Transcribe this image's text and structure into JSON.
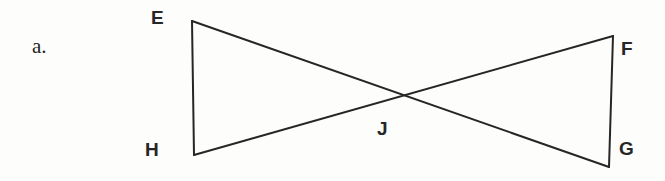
{
  "figure": {
    "item_label": "a.",
    "background_color": "#fdfdfc",
    "stroke_color": "#262626",
    "stroke_width": 2,
    "vertices": [
      {
        "name": "E",
        "label": "E",
        "x": 192,
        "y": 21,
        "label_x": 151,
        "label_y": 8
      },
      {
        "name": "F",
        "label": "F",
        "x": 613,
        "y": 36,
        "label_x": 621,
        "label_y": 39
      },
      {
        "name": "G",
        "label": "G",
        "x": 609,
        "y": 167,
        "label_x": 619,
        "label_y": 139
      },
      {
        "name": "H",
        "label": "H",
        "x": 194,
        "y": 155,
        "label_x": 145,
        "label_y": 140
      },
      {
        "name": "J",
        "label": "J",
        "x": 400,
        "y": 95,
        "label_x": 377,
        "label_y": 119
      }
    ],
    "segments": [
      {
        "name": "segment-EH",
        "from": "E",
        "to": "H"
      },
      {
        "name": "segment-FG",
        "from": "F",
        "to": "G"
      },
      {
        "name": "segment-EG",
        "from": "E",
        "to": "G"
      },
      {
        "name": "segment-HF",
        "from": "H",
        "to": "F"
      }
    ]
  }
}
